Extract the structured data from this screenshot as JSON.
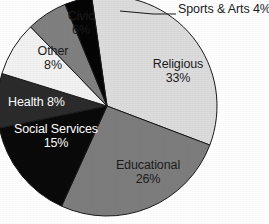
{
  "chart_data": {
    "type": "pie",
    "title": "",
    "subtitle": "",
    "xlabel": "",
    "ylabel": "",
    "legend_position": "none",
    "grid": false,
    "labels_inside": true,
    "categories": [
      "Religious",
      "Educational",
      "Social Services",
      "Health",
      "Other",
      "Civic",
      "Sports & Arts"
    ],
    "values": [
      33,
      26,
      15,
      8,
      8,
      6,
      4
    ],
    "unit": "%",
    "slices": [
      {
        "name": "Religious",
        "label": "Religious",
        "percent": 33,
        "percent_text": "33%",
        "color": "#dcdcdc",
        "text_color": "#1c1c1c",
        "label_placement": "inside"
      },
      {
        "name": "Educational",
        "label": "Educational",
        "percent": 26,
        "percent_text": "26%",
        "color": "#7d7d7d",
        "text_color": "#1c1c1c",
        "label_placement": "inside"
      },
      {
        "name": "Social Services",
        "label": "Social Services",
        "percent": 15,
        "percent_text": "15%",
        "color": "#0a0a0a",
        "text_color": "#ffffff",
        "label_placement": "inside"
      },
      {
        "name": "Health",
        "label": "Health 8%",
        "percent": 8,
        "percent_text": "8%",
        "color": "#2b2b2b",
        "text_color": "#ffffff",
        "label_placement": "inside"
      },
      {
        "name": "Other",
        "label": "Other",
        "percent": 8,
        "percent_text": "8%",
        "color": "#f2f2f2",
        "text_color": "#1c1c1c",
        "label_placement": "inside"
      },
      {
        "name": "Civic",
        "label": "Civic",
        "percent": 6,
        "percent_text": "6%",
        "color": "#808080",
        "text_color": "#1c1c1c",
        "label_placement": "inside"
      },
      {
        "name": "Sports & Arts",
        "label": "Sports & Arts 4%",
        "percent": 4,
        "percent_text": "4%",
        "color": "#050505",
        "text_color": "#1c1c1c",
        "label_placement": "callout"
      }
    ],
    "geometry": {
      "center_x": 107,
      "center_y": 106,
      "radius": 110,
      "start_angle_deg": -8,
      "direction": "clockwise"
    },
    "style": {
      "background": "#ffffff",
      "slice_outline": "#1a1a1a",
      "leader_line_color": "#1a1a1a"
    }
  }
}
